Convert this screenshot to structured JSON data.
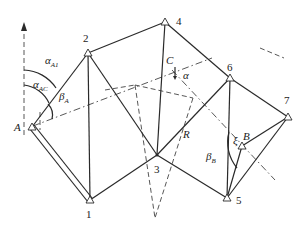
{
  "diagram": {
    "type": "survey-traverse-network",
    "points": {
      "A": {
        "label": "A",
        "x": 32,
        "y": 127
      },
      "1": {
        "label": "1",
        "x": 90,
        "y": 200
      },
      "2": {
        "label": "2",
        "x": 88,
        "y": 53
      },
      "3": {
        "label": "3",
        "x": 157,
        "y": 155
      },
      "4": {
        "label": "4",
        "x": 165,
        "y": 22
      },
      "5": {
        "label": "5",
        "x": 227,
        "y": 198
      },
      "6": {
        "label": "6",
        "x": 230,
        "y": 78
      },
      "7": {
        "label": "7",
        "x": 288,
        "y": 117
      },
      "B": {
        "label": "B",
        "x": 242,
        "y": 146
      },
      "C": {
        "label": "C",
        "x": 172,
        "y": 65
      }
    },
    "labels": {
      "A": "A",
      "B": "B",
      "C": "C",
      "p1": "1",
      "p2": "2",
      "p3": "3",
      "p4": "4",
      "p5": "5",
      "p6": "6",
      "p7": "7",
      "R": "R",
      "alpha": "α",
      "alpha_A1_main": "α",
      "alpha_A1_sub": "A1",
      "alpha_AC_main": "α",
      "alpha_AC_sub": "AC",
      "beta_A_main": "β",
      "beta_A_sub": "A",
      "beta_B_main": "β",
      "beta_B_sub": "B",
      "xi": "ξ"
    },
    "solid_edges": [
      [
        "A",
        "2"
      ],
      [
        "2",
        "1"
      ],
      [
        "2",
        "3"
      ],
      [
        "2",
        "4"
      ],
      [
        "4",
        "3"
      ],
      [
        "4",
        "6"
      ],
      [
        "3",
        "1"
      ],
      [
        "3",
        "6"
      ],
      [
        "3",
        "5"
      ],
      [
        "6",
        "5"
      ],
      [
        "6",
        "7"
      ],
      [
        "7",
        "5"
      ],
      [
        "7",
        "B"
      ],
      [
        "B",
        "5"
      ]
    ],
    "double_edge": [
      "A",
      "1"
    ],
    "dashed_lines": [
      "north-arrow at A",
      "A→C baseline",
      "C→B line",
      "3 V-shaped projection lines"
    ]
  }
}
